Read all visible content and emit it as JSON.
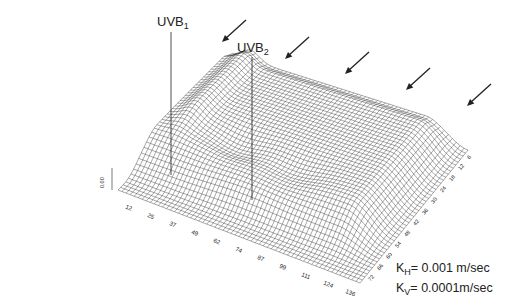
{
  "figure": {
    "annotations": [
      {
        "id": "uvb1",
        "base": "UVB",
        "sub": "1",
        "x": 157,
        "y": 14,
        "line_x": 171,
        "line_top": 32,
        "line_bottom": 175
      },
      {
        "id": "uvb2",
        "base": "UVB",
        "sub": "2",
        "x": 237,
        "y": 40,
        "line_x": 252,
        "line_top": 57,
        "line_bottom": 200
      }
    ],
    "arrows": [
      {
        "x1": 246,
        "y1": 20,
        "x2": 222,
        "y2": 42
      },
      {
        "x1": 309,
        "y1": 37,
        "x2": 285,
        "y2": 59
      },
      {
        "x1": 369,
        "y1": 52,
        "x2": 345,
        "y2": 74
      },
      {
        "x1": 430,
        "y1": 68,
        "x2": 406,
        "y2": 90
      },
      {
        "x1": 491,
        "y1": 84,
        "x2": 467,
        "y2": 106
      }
    ],
    "legend": {
      "kh_label": "K",
      "kh_sub": "H",
      "kh_value": "= 0.001 m/sec",
      "kv_label": "K",
      "kv_sub": "V",
      "kv_value": "= 0.0001m/sec"
    },
    "colors": {
      "mesh": "#3a3a3a",
      "ink": "#222222",
      "background": "#ffffff"
    }
  },
  "chart_data": {
    "type": "surface-wireframe",
    "title": "",
    "x_axis": {
      "label": "",
      "ticks": [
        12,
        25,
        37,
        49,
        62,
        74,
        87,
        99,
        111,
        124,
        136
      ]
    },
    "y_axis": {
      "label": "",
      "ticks": [
        6,
        12,
        18,
        24,
        30,
        36,
        42,
        48,
        54,
        60,
        66,
        72
      ]
    },
    "z_axis": {
      "label": "",
      "ticks": [
        "0.00"
      ]
    },
    "annotations": [
      "UVB1",
      "UVB2"
    ],
    "parameters": {
      "K_H": "0.001 m/sec",
      "K_V": "0.0001 m/sec"
    }
  }
}
